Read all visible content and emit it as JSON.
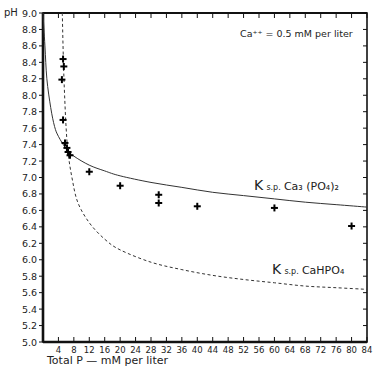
{
  "chart_data": {
    "type": "scatter",
    "title": "",
    "annotation": "Ca++ = 0.5 mM per liter",
    "xlabel": "Total P — mM per liter",
    "ylabel": "pH",
    "xlim": [
      0,
      84
    ],
    "ylim": [
      5.0,
      9.0
    ],
    "grid": false,
    "x_ticks": [
      4,
      8,
      12,
      16,
      20,
      24,
      28,
      32,
      36,
      40,
      44,
      48,
      52,
      56,
      60,
      64,
      68,
      72,
      76,
      80,
      84
    ],
    "y_ticks": [
      5.0,
      5.2,
      5.4,
      5.6,
      5.8,
      6.0,
      6.2,
      6.4,
      6.6,
      6.8,
      7.0,
      7.2,
      7.4,
      7.6,
      7.8,
      8.0,
      8.2,
      8.4,
      8.6,
      8.8,
      9.0
    ],
    "series": [
      {
        "name": "Observed",
        "style": "cross-markers",
        "points": [
          [
            5.2,
            8.44
          ],
          [
            5.4,
            8.35
          ],
          [
            4.9,
            8.19
          ],
          [
            5.2,
            7.7
          ],
          [
            5.7,
            7.42
          ],
          [
            6.2,
            7.36
          ],
          [
            6.5,
            7.31
          ],
          [
            7.0,
            7.27
          ],
          [
            12,
            7.07
          ],
          [
            20,
            6.9
          ],
          [
            30,
            6.79
          ],
          [
            30,
            6.69
          ],
          [
            40,
            6.65
          ],
          [
            60,
            6.63
          ],
          [
            80,
            6.41
          ]
        ]
      },
      {
        "name": "K sp Ca3(PO4)2",
        "style": "solid-line",
        "label": "K s.p. Ca3 (PO4)2",
        "points": [
          [
            0,
            9.0
          ],
          [
            0.5,
            8.6
          ],
          [
            1,
            8.2
          ],
          [
            2,
            7.85
          ],
          [
            3,
            7.62
          ],
          [
            4,
            7.5
          ],
          [
            6,
            7.35
          ],
          [
            8,
            7.26
          ],
          [
            12,
            7.15
          ],
          [
            16,
            7.08
          ],
          [
            20,
            7.02
          ],
          [
            28,
            6.94
          ],
          [
            36,
            6.88
          ],
          [
            44,
            6.82
          ],
          [
            52,
            6.78
          ],
          [
            60,
            6.74
          ],
          [
            68,
            6.7
          ],
          [
            76,
            6.67
          ],
          [
            84,
            6.64
          ]
        ]
      },
      {
        "name": "K sp CaHPO4",
        "style": "dashed-line",
        "label": "K s.p. CaHPO4",
        "points": [
          [
            5.0,
            9.0
          ],
          [
            5.3,
            8.4
          ],
          [
            5.6,
            8.0
          ],
          [
            6.0,
            7.6
          ],
          [
            6.5,
            7.3
          ],
          [
            7.5,
            7.0
          ],
          [
            9,
            6.7
          ],
          [
            12,
            6.45
          ],
          [
            16,
            6.25
          ],
          [
            20,
            6.12
          ],
          [
            28,
            5.97
          ],
          [
            36,
            5.88
          ],
          [
            44,
            5.81
          ],
          [
            52,
            5.76
          ],
          [
            60,
            5.72
          ],
          [
            68,
            5.68
          ],
          [
            76,
            5.66
          ],
          [
            84,
            5.64
          ]
        ]
      }
    ],
    "curve_labels": {
      "solid": "K s.p. Ca3 (PO4)2",
      "dashed": "K s.p. CaHPO4"
    }
  },
  "labels": {
    "ylabel": "pH",
    "xlabel": "Total P — mM per liter",
    "annotation": "Ca⁺⁺ = 0.5 mM per liter",
    "ksp_solid_K": "K",
    "ksp_solid_sub": "s.p.",
    "ksp_solid_formula": "Ca₃ (PO₄)₂",
    "ksp_dashed_K": "K",
    "ksp_dashed_sub": "s.p.",
    "ksp_dashed_formula": "CaHPO₄"
  }
}
